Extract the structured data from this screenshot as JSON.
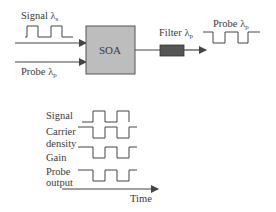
{
  "top": {
    "signal_label": "Signal",
    "signal_lambda": "λ",
    "signal_sub": "s",
    "probe_label": "Probe",
    "probe_lambda": "λ",
    "probe_sub": "p",
    "soa_label": "SOA",
    "filter_label": "Filter",
    "filter_lambda": "λ",
    "filter_sub": "p",
    "output_label": "Probe",
    "output_lambda": "λ",
    "output_sub": "p"
  },
  "timing": {
    "rows": [
      {
        "label": "Signal"
      },
      {
        "label": "Carrier",
        "label2": "density"
      },
      {
        "label": "Gain"
      },
      {
        "label": "Probe",
        "label2": "output"
      }
    ],
    "axis_label": "Time"
  },
  "colors": {
    "soa_fill": "#bdbdbd",
    "filter_fill": "#555555",
    "line": "#444444"
  }
}
